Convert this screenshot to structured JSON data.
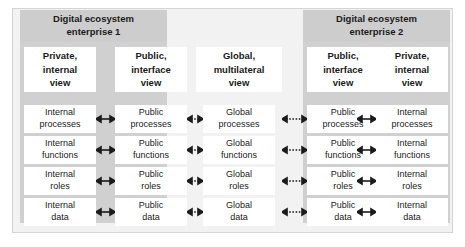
{
  "diagram": {
    "enterprises": [
      {
        "id": "enterprise-1",
        "label": "Digital ecosystem\nenterprise 1",
        "line1": "Digital ecosystem",
        "line2": "enterprise 1"
      },
      {
        "id": "enterprise-2",
        "label": "Digital ecosystem\nenterprise 2",
        "line1": "Digital ecosystem",
        "line2": "enterprise 2"
      }
    ],
    "columns": [
      {
        "id": "col-private-left",
        "line1": "Private,",
        "line2": "internal",
        "line3": "view"
      },
      {
        "id": "col-public-left",
        "line1": "Public,",
        "line2": "interface",
        "line3": "view"
      },
      {
        "id": "col-global",
        "line1": "Global,",
        "line2": "multilateral",
        "line3": "view"
      },
      {
        "id": "col-public-right",
        "line1": "Public,",
        "line2": "interface",
        "line3": "view"
      },
      {
        "id": "col-private-right",
        "line1": "Private,",
        "line2": "internal",
        "line3": "view"
      }
    ],
    "rows": [
      {
        "id": "row-processes",
        "cells": [
          {
            "line1": "Internal",
            "line2": "processes"
          },
          {
            "line1": "Public",
            "line2": "processes"
          },
          {
            "line1": "Global",
            "line2": "processes"
          },
          {
            "line1": "Public",
            "line2": "processes"
          },
          {
            "line1": "Internal",
            "line2": "processes"
          }
        ]
      },
      {
        "id": "row-functions",
        "cells": [
          {
            "line1": "Internal",
            "line2": "functions"
          },
          {
            "line1": "Public",
            "line2": "functions"
          },
          {
            "line1": "Global",
            "line2": "functions"
          },
          {
            "line1": "Public",
            "line2": "functions"
          },
          {
            "line1": "Internal",
            "line2": "functions"
          }
        ]
      },
      {
        "id": "row-roles",
        "cells": [
          {
            "line1": "Internal",
            "line2": "roles"
          },
          {
            "line1": "Public",
            "line2": "roles"
          },
          {
            "line1": "Global",
            "line2": "roles"
          },
          {
            "line1": "Public",
            "line2": "roles"
          },
          {
            "line1": "Internal",
            "line2": "roles"
          }
        ]
      },
      {
        "id": "row-data",
        "cells": [
          {
            "line1": "Internal",
            "line2": "data"
          },
          {
            "line1": "Public",
            "line2": "data"
          },
          {
            "line1": "Global",
            "line2": "data"
          },
          {
            "line1": "Public",
            "line2": "data"
          },
          {
            "line1": "Internal",
            "line2": "data"
          }
        ]
      }
    ],
    "connectors": [
      {
        "id": "connector-internal-public-left",
        "style": "solid",
        "direction": "bidirectional"
      },
      {
        "id": "connector-public-global-left",
        "style": "dotted",
        "direction": "bidirectional"
      },
      {
        "id": "connector-global-public-right",
        "style": "dotted",
        "direction": "bidirectional"
      },
      {
        "id": "connector-public-internal-right",
        "style": "solid",
        "direction": "bidirectional"
      }
    ],
    "colors": {
      "frame_background": "#f2f2f2",
      "enterprise_band": "#d0d0d0",
      "enterprise_title": "#cdcdcd",
      "box_background": "#ffffff",
      "text": "#1b1b1b",
      "arrow": "#1b1b1b"
    }
  }
}
